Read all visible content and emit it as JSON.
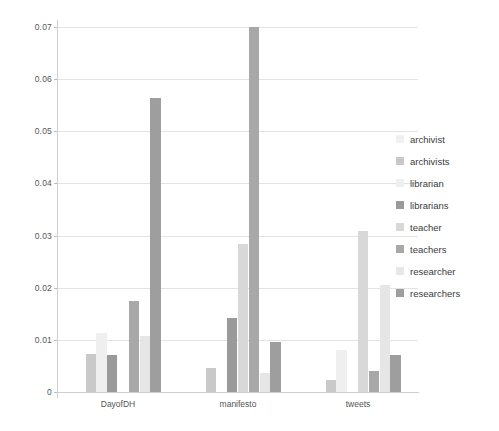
{
  "chart_data": {
    "type": "bar",
    "title": "",
    "subtitle": "",
    "xlabel": "",
    "ylabel": "",
    "categories": [
      "DayofDH",
      "manifesto",
      "tweets"
    ],
    "ylim": [
      0,
      0.07
    ],
    "ytick_labels": [
      "0",
      "0.01",
      "0.02",
      "0.03",
      "0.04",
      "0.05",
      "0.06",
      "0.07"
    ],
    "ytick_values": [
      0,
      0.01,
      0.02,
      0.03,
      0.04,
      0.05,
      0.06,
      0.07
    ],
    "grid": true,
    "legend_position": "right",
    "series": [
      {
        "name": "archivist",
        "color": "#f0f0f0",
        "values": [
          0.0,
          0.0,
          0.0
        ]
      },
      {
        "name": "archivists",
        "color": "#c9c9c9",
        "values": [
          0.0073,
          0.0046,
          0.0024
        ]
      },
      {
        "name": "librarian",
        "color": "#efefef",
        "values": [
          0.0113,
          0.0,
          0.0081
        ]
      },
      {
        "name": "librarians",
        "color": "#9a9a9a",
        "values": [
          0.0071,
          0.0141,
          0.0
        ]
      },
      {
        "name": "teacher",
        "color": "#d8d8d8",
        "values": [
          0.0,
          0.0283,
          0.0308
        ]
      },
      {
        "name": "teachers",
        "color": "#a8a8a8",
        "values": [
          0.0174,
          0.07,
          0.004
        ]
      },
      {
        "name": "researcher",
        "color": "#e6e6e6",
        "values": [
          0.0108,
          0.0037,
          0.0205
        ]
      },
      {
        "name": "researchers",
        "color": "#9e9e9e",
        "values": [
          0.0563,
          0.0095,
          0.0071
        ]
      }
    ]
  },
  "legend": {
    "items": [
      {
        "label": "archivist"
      },
      {
        "label": "archivists"
      },
      {
        "label": "librarian"
      },
      {
        "label": "librarians"
      },
      {
        "label": "teacher"
      },
      {
        "label": "teachers"
      },
      {
        "label": "researcher"
      },
      {
        "label": "researchers"
      }
    ]
  }
}
